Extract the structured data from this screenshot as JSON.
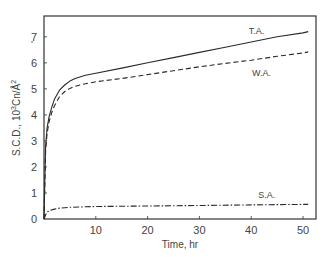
{
  "chart_data": {
    "type": "line",
    "title": "",
    "xlabel": "Time, hr",
    "ylabel": "S.C.D., 10³Cn/Å²",
    "xlim": [
      0,
      52.5
    ],
    "ylim": [
      0,
      7.8
    ],
    "grid": false,
    "legend": "inline labels",
    "xticks": [
      10,
      20,
      30,
      40,
      50
    ],
    "yticks": [
      0,
      1,
      2,
      3,
      4,
      5,
      6,
      7
    ],
    "series": [
      {
        "name": "T.A.",
        "style": "solid",
        "x": [
          0,
          0.3,
          0.6,
          1,
          1.5,
          2,
          3,
          4,
          5,
          6,
          8,
          10,
          15,
          20,
          25,
          30,
          35,
          40,
          45,
          50,
          51
        ],
        "y": [
          0,
          2.8,
          3.5,
          3.95,
          4.3,
          4.6,
          4.95,
          5.15,
          5.3,
          5.4,
          5.52,
          5.6,
          5.8,
          6.0,
          6.2,
          6.4,
          6.6,
          6.8,
          7.0,
          7.15,
          7.2
        ]
      },
      {
        "name": "W.A.",
        "style": "dashed",
        "x": [
          0,
          0.3,
          0.6,
          1,
          1.5,
          2,
          3,
          4,
          5,
          6,
          8,
          10,
          15,
          20,
          25,
          30,
          35,
          40,
          45,
          50,
          51
        ],
        "y": [
          0,
          2.6,
          3.3,
          3.75,
          4.1,
          4.35,
          4.7,
          4.9,
          5.02,
          5.1,
          5.2,
          5.27,
          5.4,
          5.55,
          5.7,
          5.85,
          5.98,
          6.1,
          6.25,
          6.38,
          6.42
        ]
      },
      {
        "name": "S.A.",
        "style": "dash-dot",
        "x": [
          0,
          0.5,
          1,
          2,
          3,
          5,
          8,
          10,
          20,
          30,
          40,
          50,
          51
        ],
        "y": [
          0,
          0.25,
          0.32,
          0.38,
          0.42,
          0.45,
          0.47,
          0.48,
          0.5,
          0.52,
          0.54,
          0.56,
          0.56
        ]
      }
    ],
    "annotations": [
      {
        "text": "T.A.",
        "x": 41,
        "y": 7.1
      },
      {
        "text": "W.A.",
        "x": 42,
        "y": 5.5
      },
      {
        "text": "S.A.",
        "x": 43,
        "y": 0.8
      }
    ]
  },
  "axes": {
    "x_title": "Time, hr",
    "y_title_main": "S.C.D., 10",
    "y_title_sup": "3",
    "y_title_unit": "Cn/Å",
    "y_title_sup2": "2",
    "origin_label": "0"
  },
  "colors": {
    "line": "#2a2a2a",
    "frame": "#333333"
  }
}
